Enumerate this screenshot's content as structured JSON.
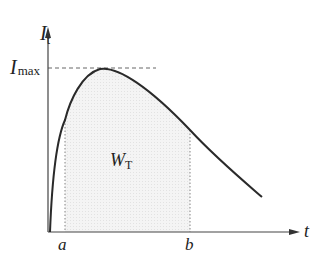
{
  "diagram": {
    "y_axis_label": {
      "main": "I",
      "sub": "t"
    },
    "x_axis_label": "t",
    "imax_label": {
      "main": "I",
      "sub": "max"
    },
    "area_label": {
      "main": "W",
      "sub": "T"
    },
    "marker_a": "a",
    "marker_b": "b",
    "colors": {
      "curve": "#2a2a2a",
      "axis": "#444444",
      "fill": "#f1f1f1",
      "dashed": "#555555"
    }
  }
}
